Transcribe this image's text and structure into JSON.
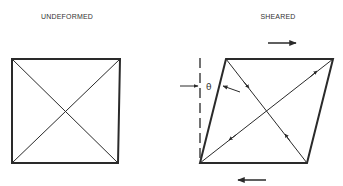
{
  "diagram": {
    "type": "shear-deformation",
    "colors": {
      "stroke": "#2a2a2a",
      "background": "#ffffff"
    },
    "undeformed": {
      "label": "UNDEFORMED",
      "shape": "square",
      "corners": {
        "tl": [
          12,
          59
        ],
        "tr": [
          120,
          59
        ],
        "br": [
          118,
          163
        ],
        "bl": [
          12,
          163
        ]
      },
      "diagonals": 2
    },
    "sheared": {
      "label": "SHEARED",
      "shape": "parallelogram",
      "corners": {
        "tl": [
          226,
          59
        ],
        "tr": [
          333,
          59
        ],
        "br": [
          307,
          163
        ],
        "bl": [
          200,
          163
        ]
      },
      "diagonals": 2,
      "angle_label": "θ",
      "reference_line": "dashed-vertical",
      "shear_arrows": {
        "top": "right",
        "bottom": "left"
      },
      "diagonal_arrows": {
        "long_diagonal": "elongation (arrows point outward)",
        "short_diagonal": "compression (arrows point inward)"
      }
    }
  }
}
